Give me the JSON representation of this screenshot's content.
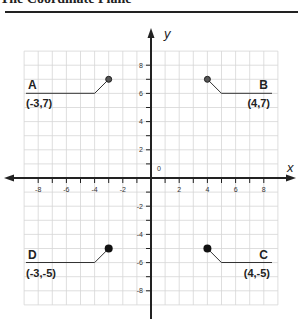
{
  "title": "The Coordinate Plane",
  "chart_data": {
    "type": "scatter",
    "title": "The Coordinate Plane",
    "xlabel": "x",
    "ylabel": "y",
    "xlim": [
      -9,
      9
    ],
    "ylim": [
      -9,
      9
    ],
    "grid": true,
    "origin_label": "0",
    "x_tick_labels": [
      "-8",
      "-6",
      "-4",
      "-2",
      "2",
      "4",
      "6",
      "8"
    ],
    "y_tick_labels": [
      "8",
      "6",
      "4",
      "2",
      "-2",
      "-4",
      "-6",
      "-8"
    ],
    "points": [
      {
        "name": "A",
        "label": "(-3,7)",
        "x": -3,
        "y": 7
      },
      {
        "name": "B",
        "label": "(4,7)",
        "x": 4,
        "y": 7
      },
      {
        "name": "C",
        "label": "(4,-5)",
        "x": 4,
        "y": -5
      },
      {
        "name": "D",
        "label": "(-3,-5)",
        "x": -3,
        "y": -5
      }
    ]
  }
}
